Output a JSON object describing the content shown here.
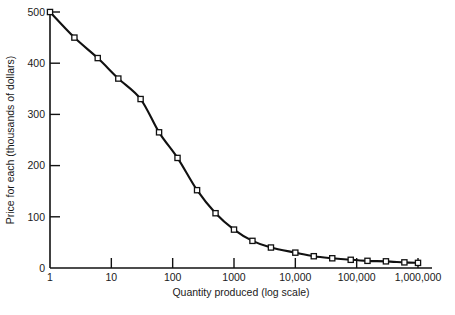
{
  "chart_data": {
    "type": "line",
    "title": "",
    "subtitle": "",
    "xlabel": "Quantity produced (log scale)",
    "ylabel": "Price for each  (thousands of dollars)",
    "xscale": "log",
    "yscale": "linear",
    "xlim": [
      1,
      1000000
    ],
    "ylim": [
      0,
      500
    ],
    "grid": false,
    "legend": null,
    "marker": "open-square",
    "line_color": "#111111",
    "marker_face_color": "#ffffff",
    "marker_edge_color": "#111111",
    "xticks": [
      1,
      10,
      100,
      1000,
      10000,
      100000,
      1000000
    ],
    "xticklabels": [
      "1",
      "10",
      "100",
      "1000",
      "10,000",
      "100,000",
      "1,000,000"
    ],
    "yticks": [
      0,
      100,
      200,
      300,
      400,
      500
    ],
    "yticklabels": [
      "0",
      "100",
      "200",
      "300",
      "400",
      "500"
    ],
    "x": [
      1,
      2.5,
      6,
      13,
      30,
      60,
      120,
      250,
      500,
      1000,
      2000,
      4000,
      10000,
      20000,
      40000,
      80000,
      150000,
      300000,
      600000,
      1000000
    ],
    "y": [
      500,
      450,
      410,
      370,
      330,
      265,
      215,
      152,
      107,
      75,
      53,
      40,
      30,
      23,
      19,
      16,
      14,
      13,
      11,
      10
    ],
    "series": [
      {
        "name": "Price per unit",
        "x": [
          1,
          2.5,
          6,
          13,
          30,
          60,
          120,
          250,
          500,
          1000,
          2000,
          4000,
          10000,
          20000,
          40000,
          80000,
          150000,
          300000,
          600000,
          1000000
        ],
        "values": [
          500,
          450,
          410,
          370,
          330,
          265,
          215,
          152,
          107,
          75,
          53,
          40,
          30,
          23,
          19,
          16,
          14,
          13,
          11,
          10
        ]
      }
    ]
  }
}
